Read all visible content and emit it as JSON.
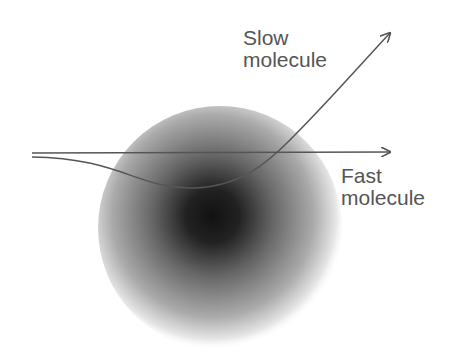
{
  "diagram": {
    "labels": {
      "slow_line1": "Slow",
      "slow_line2": "molecule",
      "fast_line1": "Fast",
      "fast_line2": "molecule"
    },
    "colors": {
      "line": "#555555",
      "core": "#111111"
    }
  }
}
